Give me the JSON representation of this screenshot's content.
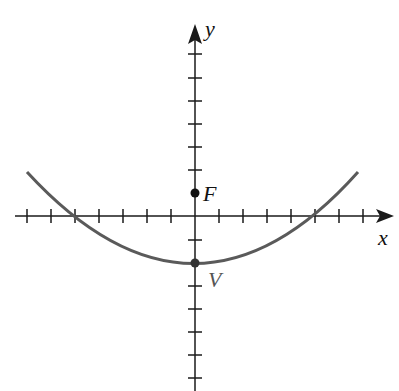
{
  "figure": {
    "type": "parabola-diagram",
    "axes": {
      "x_label": "x",
      "y_label": "y"
    },
    "points": [
      {
        "label": "F",
        "name": "focus",
        "x": 0,
        "y": 1
      },
      {
        "label": "V",
        "name": "vertex",
        "x": 0,
        "y": -2
      }
    ],
    "curve": {
      "equation": "x^2 = 12(y + 2)",
      "color": "#5a5a5a"
    },
    "tick_spacing_units": 1,
    "colors": {
      "axis": "#1a1a1a",
      "curve": "#5a5a5a",
      "label_V": "#555555"
    }
  }
}
